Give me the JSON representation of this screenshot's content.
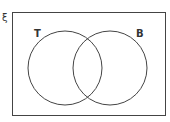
{
  "diagram": {
    "type": "venn",
    "universal_symbol": "ξ",
    "sets": [
      {
        "label": "T"
      },
      {
        "label": "B"
      }
    ],
    "colors": {
      "stroke": "#444444",
      "background": "#ffffff"
    }
  }
}
